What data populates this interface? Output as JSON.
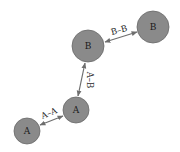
{
  "diagram": {
    "type": "graph",
    "colors": {
      "node_fill": "#8a8a8a",
      "node_stroke": "#6a6a6a",
      "edge": "#6e6e6e",
      "text": "#1a1a1a",
      "background": "#ffffff"
    },
    "nodes": [
      {
        "id": "a1",
        "label": "A",
        "cx": 27,
        "cy": 131,
        "r": 13
      },
      {
        "id": "a2",
        "label": "A",
        "cx": 76,
        "cy": 110,
        "r": 13
      },
      {
        "id": "b1",
        "label": "B",
        "cx": 88,
        "cy": 46,
        "r": 16
      },
      {
        "id": "b2",
        "label": "B",
        "cx": 153,
        "cy": 27,
        "r": 16
      }
    ],
    "edges": [
      {
        "from": "a1",
        "to": "a2",
        "label": "A–A",
        "direction": "bidirectional"
      },
      {
        "from": "a2",
        "to": "b1",
        "label": "A–B",
        "direction": "bidirectional"
      },
      {
        "from": "b1",
        "to": "b2",
        "label": "B–B",
        "direction": "bidirectional"
      }
    ]
  }
}
